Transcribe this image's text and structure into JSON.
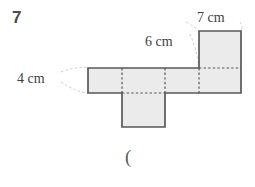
{
  "page": {
    "question_number": "7",
    "background_color": "#ffffff",
    "trailing_text": "("
  },
  "figure": {
    "type": "net-of-rectangular-prism",
    "fill_color": "#ebebeb",
    "stroke_color": "#595959",
    "dashed_color": "#555555",
    "leader_color": "#bdbdbd",
    "labels": [
      {
        "id": "top-right",
        "text": "7 cm",
        "describes": "width-of-top-square"
      },
      {
        "id": "middle",
        "text": "6 cm",
        "describes": "height-of-top-square"
      },
      {
        "id": "left",
        "text": "4 cm",
        "describes": "height-of-horizontal-strip"
      }
    ],
    "geometry": {
      "strip": {
        "x": 88,
        "y": 68,
        "width": 153,
        "height": 25
      },
      "strip_dividers_x": [
        122,
        165,
        199
      ],
      "bottom_flap": {
        "x": 122,
        "y": 93,
        "width": 43,
        "height": 34
      },
      "top_square": {
        "x": 199,
        "y": 31,
        "width": 42,
        "height": 37
      }
    }
  }
}
